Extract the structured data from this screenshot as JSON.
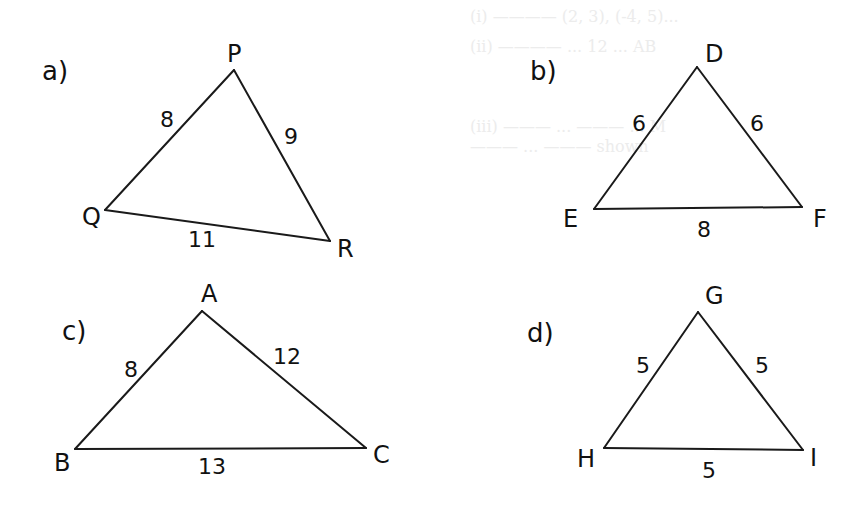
{
  "diagrams": [
    {
      "part_label": "a)",
      "part_pos": [
        42,
        80
      ],
      "vertices": [
        {
          "name": "P",
          "x": 234,
          "y": 70,
          "lx": 227,
          "ly": 62
        },
        {
          "name": "Q",
          "x": 105,
          "y": 210,
          "lx": 82,
          "ly": 225
        },
        {
          "name": "R",
          "x": 330,
          "y": 241,
          "lx": 337,
          "ly": 257
        }
      ],
      "sides": [
        {
          "from": "P",
          "to": "Q",
          "length": "8",
          "lx": 160,
          "ly": 127
        },
        {
          "from": "P",
          "to": "R",
          "length": "9",
          "lx": 284,
          "ly": 144
        },
        {
          "from": "Q",
          "to": "R",
          "length": "11",
          "lx": 188,
          "ly": 247
        }
      ]
    },
    {
      "part_label": "b)",
      "part_pos": [
        530,
        80
      ],
      "vertices": [
        {
          "name": "D",
          "x": 697,
          "y": 67,
          "lx": 705,
          "ly": 62
        },
        {
          "name": "E",
          "x": 594,
          "y": 209,
          "lx": 563,
          "ly": 227
        },
        {
          "name": "F",
          "x": 802,
          "y": 207,
          "lx": 813,
          "ly": 227
        }
      ],
      "sides": [
        {
          "from": "D",
          "to": "E",
          "length": "6",
          "lx": 632,
          "ly": 131
        },
        {
          "from": "D",
          "to": "F",
          "length": "6",
          "lx": 750,
          "ly": 131
        },
        {
          "from": "E",
          "to": "F",
          "length": "8",
          "lx": 697,
          "ly": 237
        }
      ]
    },
    {
      "part_label": "c)",
      "part_pos": [
        62,
        340
      ],
      "vertices": [
        {
          "name": "A",
          "x": 202,
          "y": 311,
          "lx": 201,
          "ly": 302
        },
        {
          "name": "B",
          "x": 75,
          "y": 449,
          "lx": 54,
          "ly": 471
        },
        {
          "name": "C",
          "x": 366,
          "y": 448,
          "lx": 373,
          "ly": 463
        }
      ],
      "sides": [
        {
          "from": "A",
          "to": "B",
          "length": "8",
          "lx": 124,
          "ly": 377
        },
        {
          "from": "A",
          "to": "C",
          "length": "12",
          "lx": 273,
          "ly": 364
        },
        {
          "from": "B",
          "to": "C",
          "length": "13",
          "lx": 198,
          "ly": 474
        }
      ]
    },
    {
      "part_label": "d)",
      "part_pos": [
        527,
        342
      ],
      "vertices": [
        {
          "name": "G",
          "x": 698,
          "y": 312,
          "lx": 705,
          "ly": 304
        },
        {
          "name": "H",
          "x": 604,
          "y": 448,
          "lx": 577,
          "ly": 467
        },
        {
          "name": "I",
          "x": 803,
          "y": 450,
          "lx": 810,
          "ly": 466
        }
      ],
      "sides": [
        {
          "from": "G",
          "to": "H",
          "length": "5",
          "lx": 636,
          "ly": 373
        },
        {
          "from": "G",
          "to": "I",
          "length": "5",
          "lx": 755,
          "ly": 373
        },
        {
          "from": "H",
          "to": "I",
          "length": "5",
          "lx": 702,
          "ly": 478
        }
      ]
    }
  ]
}
